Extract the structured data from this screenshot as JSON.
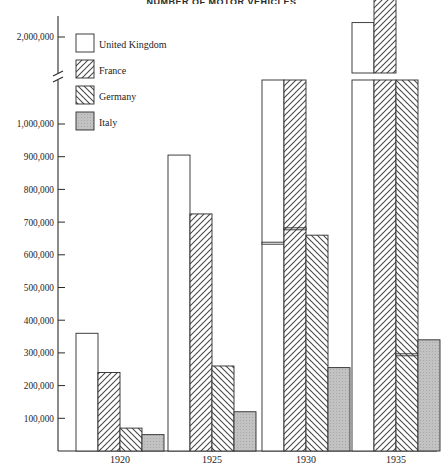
{
  "title": "NUMBER OF MOTOR VEHICLES",
  "legend": {
    "position": "top-left",
    "items": [
      {
        "label": "United Kingdom",
        "swatch": "white-swatch-icon",
        "fill": "#ffffff"
      },
      {
        "label": "France",
        "swatch": "forward-hatch-swatch-icon",
        "fill": "hatch-forward"
      },
      {
        "label": "Germany",
        "swatch": "back-hatch-swatch-icon",
        "fill": "hatch-back"
      },
      {
        "label": "Italy",
        "swatch": "gray-swatch-icon",
        "fill": "#b9b9b9"
      }
    ]
  },
  "axis": {
    "y_ticks": [
      "100,000",
      "200,000",
      "300,000",
      "400,000",
      "500,000",
      "600,000",
      "700,000",
      "800,000",
      "900,000",
      "1,000,000",
      "2,000,000"
    ],
    "y_break_between": [
      "1,000,000",
      "2,000,000"
    ],
    "x_ticks": [
      "1920",
      "1925",
      "1930",
      "1935"
    ]
  },
  "chart_data": {
    "type": "bar",
    "title": "NUMBER OF MOTOR VEHICLES",
    "xlabel": "",
    "ylabel": "",
    "categories": [
      "1920",
      "1925",
      "1930",
      "1935"
    ],
    "series": [
      {
        "name": "United Kingdom",
        "values": [
          360000,
          905000,
          1430000,
          2040000
        ]
      },
      {
        "name": "France",
        "values": [
          240000,
          725000,
          1470000,
          2160000
        ]
      },
      {
        "name": "Germany",
        "values": [
          70000,
          260000,
          660000,
          1120000
        ]
      },
      {
        "name": "Italy",
        "values": [
          50000,
          120000,
          255000,
          340000
        ]
      }
    ],
    "ylim": [
      0,
      2100000
    ],
    "y_tick_values": [
      100000,
      200000,
      300000,
      400000,
      500000,
      600000,
      700000,
      800000,
      900000,
      1000000,
      2000000
    ],
    "axis_break": {
      "from": 1000000,
      "to": 1900000
    },
    "grid": false,
    "legend_position": "top-left"
  }
}
